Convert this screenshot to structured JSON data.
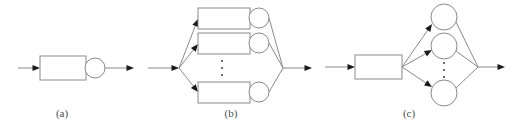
{
  "figure": {
    "background_color": "#ffffff",
    "line_color": "#8a8a8a",
    "arrowhead_color": "#1a1a1a",
    "caption_color": "#4d4d4d"
  },
  "panels": [
    {
      "id": "a",
      "caption": "(a)",
      "caption_x": 62,
      "caption_y": 117,
      "description": "single rectangle followed by single circle",
      "rectangles": [
        {
          "name": "rect-a-1",
          "x": 40,
          "y": 56,
          "w": 46,
          "h": 24
        }
      ],
      "circles": [
        {
          "name": "circle-a-1",
          "cx": 95,
          "cy": 68,
          "r": 10
        }
      ],
      "ellipsis": [],
      "arrows": [
        {
          "name": "arrow-a-in",
          "x1": 18,
          "y1": 68,
          "x2": 40,
          "y2": 68,
          "head": true
        },
        {
          "name": "arrow-a-out",
          "x1": 105,
          "y1": 68,
          "x2": 134,
          "y2": 68,
          "head": true
        }
      ],
      "plain_lines": []
    },
    {
      "id": "b",
      "caption": "(b)",
      "caption_x": 231,
      "caption_y": 117,
      "description": "fan-out to N parallel rectangle-plus-circle branches, then fan-in",
      "rectangles": [
        {
          "name": "rect-b-1",
          "x": 198,
          "y": 8,
          "w": 52,
          "h": 21
        },
        {
          "name": "rect-b-2",
          "x": 198,
          "y": 33,
          "w": 52,
          "h": 21
        },
        {
          "name": "rect-b-n",
          "x": 198,
          "y": 82,
          "w": 52,
          "h": 21
        }
      ],
      "circles": [
        {
          "name": "circle-b-1",
          "cx": 259,
          "cy": 18,
          "r": 10
        },
        {
          "name": "circle-b-2",
          "cx": 259,
          "cy": 43,
          "r": 10
        },
        {
          "name": "circle-b-n",
          "cx": 259,
          "cy": 92,
          "r": 10
        }
      ],
      "ellipsis": [
        {
          "name": "ellipsis-b",
          "cx": 222,
          "dots_y": [
            61,
            68,
            75
          ],
          "r": 1.1
        }
      ],
      "arrows": [
        {
          "name": "arrow-b-in",
          "x1": 148,
          "y1": 68,
          "x2": 179,
          "y2": 68,
          "head": true
        },
        {
          "name": "arrow-b-branch-1",
          "x1": 179,
          "y1": 68,
          "x2": 198,
          "y2": 19,
          "head": true
        },
        {
          "name": "arrow-b-branch-2",
          "x1": 179,
          "y1": 68,
          "x2": 198,
          "y2": 44,
          "head": true
        },
        {
          "name": "arrow-b-branch-n",
          "x1": 179,
          "y1": 68,
          "x2": 198,
          "y2": 92,
          "head": true
        },
        {
          "name": "arrow-b-out",
          "x1": 283,
          "y1": 68,
          "x2": 312,
          "y2": 68,
          "head": true
        }
      ],
      "plain_lines": [
        {
          "name": "line-b-merge-1",
          "x1": 269,
          "y1": 18,
          "x2": 283,
          "y2": 68
        },
        {
          "name": "line-b-merge-2",
          "x1": 269,
          "y1": 43,
          "x2": 283,
          "y2": 68
        },
        {
          "name": "line-b-merge-n",
          "x1": 269,
          "y1": 92,
          "x2": 283,
          "y2": 68
        }
      ]
    },
    {
      "id": "c",
      "caption": "(c)",
      "caption_x": 409,
      "caption_y": 117,
      "description": "single rectangle fanning out to N parallel circles, then fan-in",
      "rectangles": [
        {
          "name": "rect-c-1",
          "x": 355,
          "y": 55,
          "w": 47,
          "h": 24
        }
      ],
      "circles": [
        {
          "name": "circle-c-1",
          "cx": 444,
          "cy": 17,
          "r": 13
        },
        {
          "name": "circle-c-2",
          "cx": 444,
          "cy": 46,
          "r": 13
        },
        {
          "name": "circle-c-n",
          "cx": 444,
          "cy": 93,
          "r": 13
        }
      ],
      "ellipsis": [
        {
          "name": "ellipsis-c",
          "cx": 444,
          "dots_y": [
            63,
            70,
            77
          ],
          "r": 1.1
        }
      ],
      "arrows": [
        {
          "name": "arrow-c-in",
          "x1": 325,
          "y1": 67,
          "x2": 355,
          "y2": 67,
          "head": true
        },
        {
          "name": "arrow-c-branch-1",
          "x1": 402,
          "y1": 67,
          "x2": 432,
          "y2": 24,
          "head": true
        },
        {
          "name": "arrow-c-branch-2",
          "x1": 402,
          "y1": 67,
          "x2": 432,
          "y2": 50,
          "head": true
        },
        {
          "name": "arrow-c-branch-n",
          "x1": 402,
          "y1": 67,
          "x2": 432,
          "y2": 87,
          "head": true
        },
        {
          "name": "arrow-c-out",
          "x1": 478,
          "y1": 67,
          "x2": 505,
          "y2": 67,
          "head": true
        }
      ],
      "plain_lines": [
        {
          "name": "line-c-merge-1",
          "x1": 456,
          "y1": 22,
          "x2": 478,
          "y2": 67
        },
        {
          "name": "line-c-merge-2",
          "x1": 456,
          "y1": 51,
          "x2": 478,
          "y2": 67
        },
        {
          "name": "line-c-merge-n",
          "x1": 456,
          "y1": 88,
          "x2": 478,
          "y2": 67
        }
      ]
    }
  ]
}
